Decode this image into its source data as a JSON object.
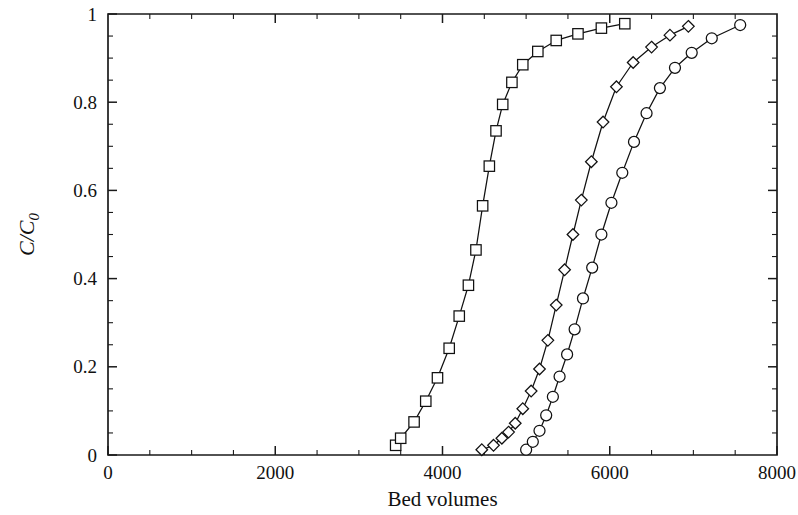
{
  "chart_data": {
    "type": "line",
    "title": "",
    "subtitle": "",
    "xlabel": "Bed volumes",
    "ylabel": "C/C0",
    "ylabel_main": "C/C",
    "ylabel_sub": "0",
    "xlim": [
      0,
      8000
    ],
    "ylim": [
      0,
      1
    ],
    "xticks": [
      0,
      2000,
      4000,
      6000,
      8000
    ],
    "xtick_labels": [
      "0",
      "2000",
      "4000",
      "6000",
      "8000"
    ],
    "yticks": [
      0,
      0.2,
      0.4,
      0.6,
      0.8,
      1
    ],
    "ytick_labels": [
      "0",
      "0.2",
      "0.4",
      "0.6",
      "0.8",
      "1"
    ],
    "x_minor_tick_step": 500,
    "y_minor_tick_step": 0.05,
    "grid": false,
    "legend": false,
    "legend_position": "none",
    "line_color": "#111111",
    "marker_fill": "#ffffff",
    "axis_color": "#1a1a1a",
    "series": [
      {
        "name": "square-series",
        "marker": "square",
        "x": [
          3440,
          3500,
          3660,
          3800,
          3940,
          4080,
          4200,
          4310,
          4400,
          4480,
          4560,
          4640,
          4720,
          4830,
          4960,
          5140,
          5360,
          5620,
          5900,
          6180
        ],
        "y": [
          0.022,
          0.038,
          0.075,
          0.122,
          0.175,
          0.242,
          0.315,
          0.385,
          0.465,
          0.565,
          0.655,
          0.735,
          0.795,
          0.845,
          0.885,
          0.915,
          0.94,
          0.955,
          0.968,
          0.978
        ]
      },
      {
        "name": "diamond-series",
        "marker": "diamond",
        "x": [
          4470,
          4610,
          4710,
          4790,
          4870,
          4960,
          5060,
          5160,
          5260,
          5360,
          5460,
          5560,
          5660,
          5780,
          5920,
          6080,
          6280,
          6500,
          6720,
          6940
        ],
        "y": [
          0.012,
          0.022,
          0.038,
          0.052,
          0.072,
          0.105,
          0.145,
          0.195,
          0.26,
          0.34,
          0.42,
          0.5,
          0.578,
          0.665,
          0.755,
          0.835,
          0.89,
          0.925,
          0.952,
          0.972
        ]
      },
      {
        "name": "circle-series",
        "marker": "circle",
        "x": [
          5000,
          5080,
          5160,
          5240,
          5320,
          5400,
          5490,
          5580,
          5680,
          5790,
          5900,
          6020,
          6150,
          6290,
          6440,
          6600,
          6780,
          6980,
          7220,
          7560
        ],
        "y": [
          0.012,
          0.03,
          0.055,
          0.09,
          0.132,
          0.178,
          0.228,
          0.285,
          0.355,
          0.425,
          0.5,
          0.572,
          0.64,
          0.71,
          0.775,
          0.832,
          0.878,
          0.912,
          0.945,
          0.975
        ]
      }
    ]
  },
  "plot_geometry": {
    "left": 108,
    "right": 777,
    "top": 14,
    "bottom": 455
  }
}
